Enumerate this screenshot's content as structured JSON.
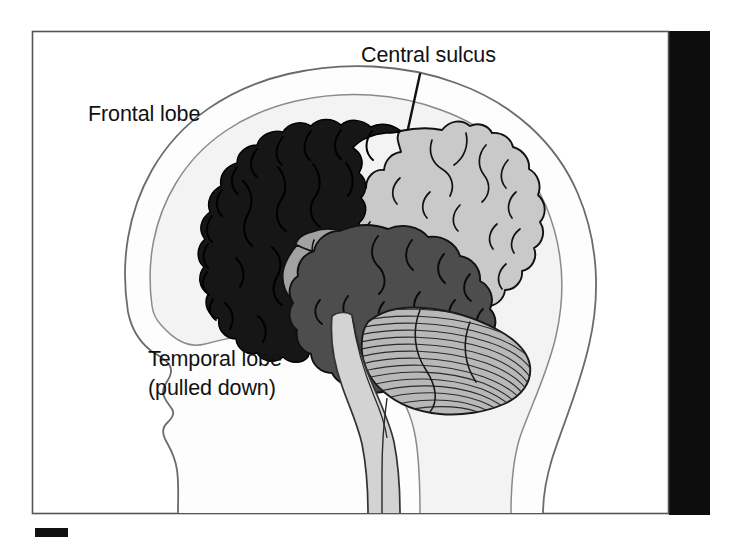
{
  "figure": {
    "type": "anatomical-illustration",
    "background_color": "#ffffff",
    "frame": {
      "border_color": "#555555",
      "fill_color": "#ffffff",
      "x": 32,
      "y": 31,
      "width": 637,
      "height": 483
    },
    "side_bar": {
      "name": "page-edge-bar",
      "color": "#0d0d0d",
      "x": 669,
      "y": 31,
      "width": 41,
      "height": 484
    },
    "scale_mark": {
      "name": "scale-bar-mark",
      "color": "#111111",
      "x": 35,
      "y": 528,
      "width": 33,
      "height": 9
    }
  },
  "labels": [
    {
      "id": "frontal-lobe",
      "text": "Frontal lobe",
      "lines": [
        "Frontal lobe"
      ],
      "x": 88,
      "y": 121,
      "anchor": "start",
      "has_leader_line": false
    },
    {
      "id": "central-sulcus",
      "text": "Central sulcus",
      "lines": [
        "Central sulcus"
      ],
      "x": 361,
      "y": 62,
      "anchor": "start",
      "has_leader_line": true,
      "leader_line": {
        "x1": 420,
        "y1": 74,
        "x2": 408,
        "y2": 129
      }
    },
    {
      "id": "temporal-lobe",
      "text": "Temporal lobe (pulled down)",
      "lines": [
        "Temporal lobe",
        "(pulled down)"
      ],
      "x": 148,
      "y": 366,
      "anchor": "start",
      "has_leader_line": false
    }
  ],
  "regions": [
    {
      "id": "head-silhouette",
      "name": "head-profile",
      "fill": "#fdfdfd",
      "stroke": "#6b6b6b",
      "description": "Outline of a human head facing left, including forehead, nose, lips, chin and neck"
    },
    {
      "id": "skull-interior",
      "name": "cranial-cavity",
      "fill": "#f3f3f3",
      "stroke": "#8a8a8a",
      "description": "Inner cranial cavity outline surrounding the brain"
    },
    {
      "id": "frontal-lobe-region",
      "name": "frontal-lobe",
      "fill": "#161616",
      "stroke": "#000000",
      "description": "Frontal lobe, shaded black, anterior to the central sulcus"
    },
    {
      "id": "parietal-occipital-region",
      "name": "parietal-occipital-lobe",
      "fill": "#c9c9c9",
      "stroke": "#111111",
      "description": "Parietal and occipital lobes, light grey, posterior to the central sulcus"
    },
    {
      "id": "insula-region",
      "name": "insula",
      "fill": "#a2a2a2",
      "stroke": "#111111",
      "description": "Insular cortex, medium grey, exposed because the temporal lobe is pulled down"
    },
    {
      "id": "temporal-lobe-region",
      "name": "temporal-lobe",
      "fill": "#4d4d4d",
      "stroke": "#111111",
      "description": "Temporal lobe, dark grey, displaced downward"
    },
    {
      "id": "cerebellum-region",
      "name": "cerebellum",
      "fill": "#b8b8b8",
      "stroke": "#1a1a1a",
      "description": "Cerebellum with fine horizontal folia striations"
    },
    {
      "id": "brainstem-region",
      "name": "brainstem",
      "fill": "#d3d3d3",
      "stroke": "#333333",
      "description": "Brainstem and spinal cord descending through the neck"
    }
  ],
  "colors": {
    "black": "#0d0d0d",
    "frontal": "#161616",
    "parietal": "#c9c9c9",
    "insula": "#a2a2a2",
    "temporal": "#4d4d4d",
    "cerebellum": "#b8b8b8",
    "brainstem": "#d3d3d3",
    "head_fill": "#fdfdfd",
    "cavity_fill": "#f3f3f3",
    "frame_border": "#555555",
    "text": "#111111"
  }
}
